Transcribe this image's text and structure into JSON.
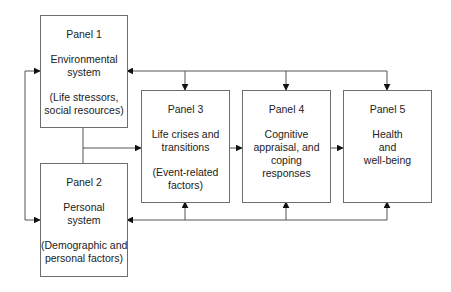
{
  "diagram": {
    "type": "flow",
    "panels": [
      {
        "id": "panel1",
        "title": "Panel 1",
        "name_lines": [
          "Environmental",
          "system"
        ],
        "sub_lines": [
          "(Life stressors,",
          "social resources)"
        ]
      },
      {
        "id": "panel2",
        "title": "Panel 2",
        "name_lines": [
          "Personal",
          "system"
        ],
        "sub_lines": [
          "(Demographic and",
          "personal factors)"
        ]
      },
      {
        "id": "panel3",
        "title": "Panel 3",
        "name_lines": [
          "Life crises and",
          "transitions"
        ],
        "sub_lines": [
          "(Event-related",
          "factors)"
        ]
      },
      {
        "id": "panel4",
        "title": "Panel 4",
        "name_lines": [
          "Cognitive",
          "appraisal, and",
          "coping",
          "responses"
        ],
        "sub_lines": []
      },
      {
        "id": "panel5",
        "title": "Panel 5",
        "name_lines": [
          "Health",
          "and",
          "well-being"
        ],
        "sub_lines": []
      }
    ],
    "edges": [
      {
        "from": "panel1",
        "to": "panel3"
      },
      {
        "from": "panel2",
        "to": "panel3"
      },
      {
        "from": "panel3",
        "to": "panel4"
      },
      {
        "from": "panel4",
        "to": "panel5"
      },
      {
        "from": "panel1",
        "to": "panel2",
        "bidirectional": true
      },
      {
        "from": "feedback-top",
        "to": [
          "panel1",
          "panel3",
          "panel4",
          "panel5"
        ]
      },
      {
        "from": "feedback-bottom",
        "to": [
          "panel2",
          "panel3",
          "panel4",
          "panel5"
        ]
      }
    ],
    "colors": {
      "stroke": "#555555",
      "box_border": "#6e6e6e",
      "text": "#222222",
      "background": "#ffffff"
    }
  }
}
